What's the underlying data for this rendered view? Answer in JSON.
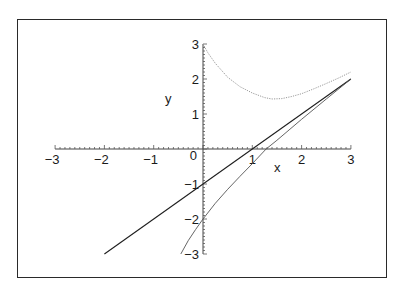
{
  "chart_data": {
    "type": "line",
    "title": "",
    "xlabel": "x",
    "ylabel": "y",
    "xlim": [
      -3,
      3
    ],
    "ylim": [
      -3,
      3
    ],
    "grid": false,
    "legend": null,
    "x_ticks": [
      "-3",
      "-2",
      "-1",
      "0",
      "1",
      "2",
      "3"
    ],
    "y_ticks": [
      "-3",
      "-2",
      "-1",
      "1",
      "2",
      "3"
    ],
    "series": [
      {
        "name": "line",
        "style": "solid-dark",
        "x": [
          -2,
          3
        ],
        "y": [
          -3,
          2
        ]
      },
      {
        "name": "lower-branch",
        "style": "solid-gray",
        "x": [
          -0.45,
          -0.3,
          -0.15,
          0,
          0.25,
          0.5,
          0.75,
          1.0,
          1.28,
          1.5,
          2.0,
          2.5,
          3.0
        ],
        "y": [
          -3.0,
          -2.62,
          -2.3,
          -2.0,
          -1.55,
          -1.15,
          -0.78,
          -0.42,
          0.0,
          0.25,
          0.85,
          1.43,
          2.0
        ]
      },
      {
        "name": "upper-curve",
        "style": "dotted-gray",
        "x": [
          0.0,
          0.1,
          0.25,
          0.5,
          0.75,
          1.0,
          1.25,
          1.4,
          1.6,
          1.8,
          2.0,
          2.25,
          2.5,
          2.75,
          3.0
        ],
        "y": [
          3.0,
          2.75,
          2.45,
          2.05,
          1.78,
          1.6,
          1.47,
          1.43,
          1.44,
          1.5,
          1.58,
          1.72,
          1.87,
          2.03,
          2.2
        ]
      }
    ]
  }
}
